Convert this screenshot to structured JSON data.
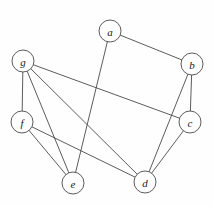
{
  "figure": {
    "title": "",
    "type": "undirected-graph-diagram",
    "width": 214,
    "height": 206,
    "background_color": "#fefefe",
    "edge_color": "#4a4a4a",
    "node_fill_color": "#ffffff",
    "node_stroke_color": "#4a4a4a",
    "label_color": "#1a1a1a",
    "node_radius": 11
  },
  "graph": {
    "node_count": 7,
    "edge_count": 11,
    "nodes": [
      {
        "id": "a",
        "label": "a",
        "x": 110,
        "y": 31
      },
      {
        "id": "b",
        "label": "b",
        "x": 192,
        "y": 64
      },
      {
        "id": "c",
        "label": "c",
        "x": 190,
        "y": 122
      },
      {
        "id": "d",
        "label": "d",
        "x": 145,
        "y": 182
      },
      {
        "id": "e",
        "label": "e",
        "x": 73,
        "y": 183
      },
      {
        "id": "f",
        "label": "f",
        "x": 22,
        "y": 122
      },
      {
        "id": "g",
        "label": "g",
        "x": 23,
        "y": 61
      }
    ],
    "edges": [
      {
        "from": "a",
        "to": "b"
      },
      {
        "from": "a",
        "to": "e"
      },
      {
        "from": "b",
        "to": "c"
      },
      {
        "from": "b",
        "to": "d"
      },
      {
        "from": "c",
        "to": "d"
      },
      {
        "from": "c",
        "to": "g"
      },
      {
        "from": "g",
        "to": "f"
      },
      {
        "from": "g",
        "to": "e"
      },
      {
        "from": "g",
        "to": "d"
      },
      {
        "from": "f",
        "to": "e"
      },
      {
        "from": "f",
        "to": "d"
      }
    ]
  }
}
